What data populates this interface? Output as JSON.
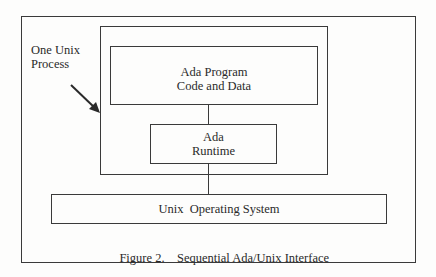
{
  "figure": {
    "caption_number": "Figure 2.",
    "caption_title": "Sequential Ada/Unix Interface"
  },
  "annotation": {
    "line1": "One Unix",
    "line2": "Process",
    "arrow": "arrow-pointing-to-process-box"
  },
  "boxes": {
    "program": {
      "line1": "Ada Program",
      "line2": "Code and Data"
    },
    "runtime": {
      "line1": "Ada",
      "line2": "Runtime"
    },
    "os": {
      "label": "Unix  Operating System"
    }
  },
  "colors": {
    "line": "#3a3a3a",
    "text": "#2a2a2a",
    "background": "#fdfdfc"
  }
}
